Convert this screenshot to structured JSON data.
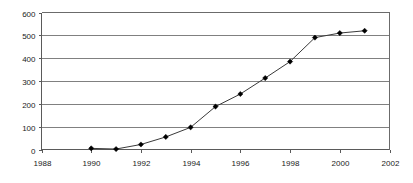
{
  "chart_data": {
    "type": "line",
    "title": "",
    "subtitle": "",
    "xlabel": "",
    "ylabel": "",
    "x": [
      1990,
      1991,
      1992,
      1993,
      1994,
      1995,
      1996,
      1997,
      1998,
      1999,
      2000,
      2001
    ],
    "values": [
      5,
      2,
      22,
      55,
      97,
      188,
      243,
      313,
      385,
      490,
      510,
      520
    ],
    "series": [
      {
        "name": "series-1",
        "values": [
          5,
          2,
          22,
          55,
          97,
          188,
          243,
          313,
          385,
          490,
          510,
          520
        ]
      }
    ],
    "xlim": [
      1988,
      2002
    ],
    "ylim": [
      0,
      600
    ],
    "x_ticks": [
      1988,
      1990,
      1992,
      1994,
      1996,
      1998,
      2000,
      2002
    ],
    "x_tick_labels": [
      "1988",
      "1990",
      "1992",
      "1994",
      "1996",
      "1998",
      "2000",
      "2002"
    ],
    "y_ticks": [
      0,
      100,
      200,
      300,
      400,
      500,
      600
    ],
    "y_tick_labels": [
      "0",
      "100",
      "200",
      "300",
      "400",
      "500",
      "600"
    ],
    "grid": "horizontal",
    "legend": "none",
    "marker": "diamond",
    "line_color": "#3a3a3a",
    "marker_color": "#000000",
    "grid_color": "#808080",
    "background_color": "#ffffff"
  }
}
